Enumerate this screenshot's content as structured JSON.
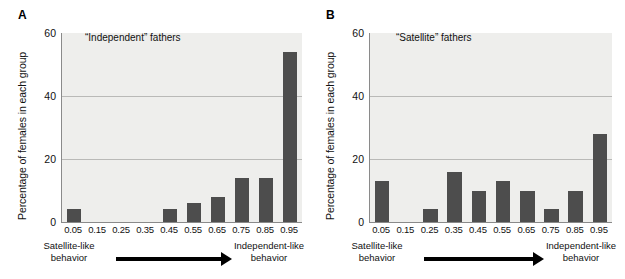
{
  "figure": {
    "panels": [
      {
        "letter": "A",
        "annotation": "“Independent” fathers",
        "ylabel": "Percentage of females in each group",
        "yticks": [
          "0",
          "20",
          "40",
          "60"
        ],
        "xticks": [
          "0.05",
          "0.15",
          "0.25",
          "0.35",
          "0.45",
          "0.55",
          "0.65",
          "0.75",
          "0.85",
          "0.95"
        ],
        "caption_left": "Satellite-like behavior",
        "caption_right": "Independent-like behavior",
        "arrow_icon": "right-arrow-icon"
      },
      {
        "letter": "B",
        "annotation": "“Satellite” fathers",
        "ylabel": "Percentage of females in each group",
        "yticks": [
          "0",
          "20",
          "40",
          "60"
        ],
        "xticks": [
          "0.05",
          "0.15",
          "0.25",
          "0.35",
          "0.45",
          "0.55",
          "0.65",
          "0.75",
          "0.85",
          "0.95"
        ],
        "caption_left": "Satellite-like behavior",
        "caption_right": "Independent-like behavior",
        "arrow_icon": "right-arrow-icon"
      }
    ],
    "colors": {
      "bar": "#4d4d4d",
      "plot_background": "#eeeeec",
      "gridline": "#b9b9b7",
      "axis": "#8a8a8a"
    }
  },
  "chart_data": [
    {
      "type": "bar",
      "title": "“Independent” fathers",
      "panel": "A",
      "categories": [
        "0.05",
        "0.15",
        "0.25",
        "0.35",
        "0.45",
        "0.55",
        "0.65",
        "0.75",
        "0.85",
        "0.95"
      ],
      "values": [
        4,
        0,
        0,
        0,
        4,
        6,
        8,
        14,
        14,
        54
      ],
      "xlabel": "",
      "ylabel": "Percentage of females in each group",
      "ylim": [
        0,
        60
      ],
      "yticks": [
        0,
        20,
        40,
        60
      ],
      "grid": true,
      "legend": "none",
      "annotations": [
        "Satellite-like behavior",
        "Independent-like behavior"
      ]
    },
    {
      "type": "bar",
      "title": "“Satellite” fathers",
      "panel": "B",
      "categories": [
        "0.05",
        "0.15",
        "0.25",
        "0.35",
        "0.45",
        "0.55",
        "0.65",
        "0.75",
        "0.85",
        "0.95"
      ],
      "values": [
        13,
        0,
        4,
        16,
        10,
        13,
        10,
        4,
        10,
        28
      ],
      "xlabel": "",
      "ylabel": "Percentage of females in each group",
      "ylim": [
        0,
        60
      ],
      "yticks": [
        0,
        20,
        40,
        60
      ],
      "grid": true,
      "legend": "none",
      "annotations": [
        "Satellite-like behavior",
        "Independent-like behavior"
      ]
    }
  ]
}
